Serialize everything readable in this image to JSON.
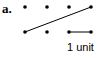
{
  "figure": {
    "label": "a.",
    "scale_label": "1 unit",
    "dots": [
      {
        "x": 25,
        "y": 7
      },
      {
        "x": 47,
        "y": 7
      },
      {
        "x": 69,
        "y": 7
      },
      {
        "x": 91,
        "y": 7
      },
      {
        "x": 25,
        "y": 32
      },
      {
        "x": 47,
        "y": 32
      },
      {
        "x": 69,
        "y": 32
      },
      {
        "x": 91,
        "y": 32
      }
    ],
    "segment": {
      "x1": 25,
      "y1": 32,
      "x2": 91,
      "y2": 7
    },
    "unit_segment": {
      "x1": 69,
      "y1": 32,
      "x2": 91,
      "y2": 32
    },
    "color": "#000000"
  }
}
